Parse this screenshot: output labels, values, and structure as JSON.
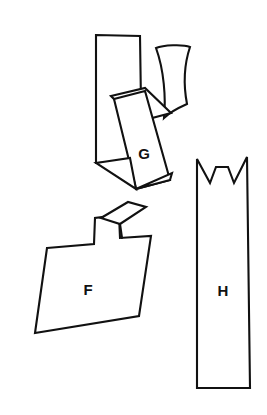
{
  "figure": {
    "kind": "line-drawing",
    "background_color": "#ffffff",
    "stroke_color": "#111111",
    "label_color": "#111111",
    "canvas": {
      "width": 267,
      "height": 415
    },
    "shapes": [
      {
        "id": "shape-g",
        "label": "G",
        "label_position": {
          "x": 144,
          "y": 155
        },
        "stroke_width": 2.1,
        "parts": [
          {
            "name": "tall-back-panel",
            "type": "polygon",
            "points": "96,35 140,36 141,104 137,161 96,163"
          },
          {
            "name": "curved-right-flap",
            "type": "path",
            "d": "M 156,48 C 163,45 183,44 190,47 C 185,62 183,83 187,104 C 178,108 170,112 164,118 C 166,98 164,70 156,48 Z"
          },
          {
            "name": "upper-fold-panel",
            "type": "polygon",
            "points": "111,96 145,88 171,113 137,122"
          },
          {
            "name": "front-tapered-panel",
            "type": "polygon",
            "points": "114,99 145,91 170,180 136,189"
          },
          {
            "name": "lower-left-fold",
            "type": "polygon",
            "points": "96,163 130,158 136,189"
          },
          {
            "name": "lower-right-fold",
            "type": "polygon",
            "points": "136,189 170,180 172,173"
          }
        ]
      },
      {
        "id": "shape-f",
        "label": "F",
        "label_position": {
          "x": 88,
          "y": 291
        },
        "stroke_width": 2.1,
        "parts": [
          {
            "name": "body-outline",
            "type": "polygon",
            "points": "47,248 94,244 95,218 119,215 120,238 151,236 139,316 35,333"
          },
          {
            "name": "top-parallelogram-flap",
            "type": "polygon",
            "points": "101,218 128,202 146,207 120,224"
          },
          {
            "name": "flap-connector-edge",
            "type": "path",
            "d": "M 120,224 L 122,238"
          }
        ]
      },
      {
        "id": "shape-h",
        "label": "H",
        "label_position": {
          "x": 223,
          "y": 292
        },
        "stroke_width": 2.1,
        "parts": [
          {
            "name": "crowned-strip-outline",
            "type": "polygon",
            "points": "197,159 210,183 216,167 228,167 234,183 247,157 250,388 197,388"
          }
        ]
      }
    ],
    "labels": [
      {
        "id": "label-g",
        "text": "G",
        "x": 144,
        "y": 155
      },
      {
        "id": "label-f",
        "text": "F",
        "x": 88,
        "y": 291
      },
      {
        "id": "label-h",
        "text": "H",
        "x": 223,
        "y": 292
      }
    ]
  }
}
